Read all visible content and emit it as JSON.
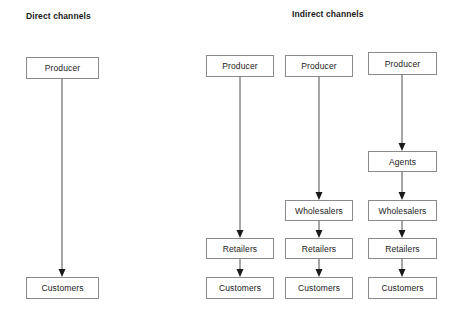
{
  "diagram": {
    "title_direct": "Direct channels",
    "title_indirect": "Indirect channels",
    "colors": {
      "background": "#ffffff",
      "box_border": "#8a8a8a",
      "text": "#1a1a1a",
      "arrow": "#4d4d4d",
      "arrow_head": "#1a1a1a"
    },
    "headings": [
      {
        "id": "direct",
        "label": "Direct channels",
        "x": 26,
        "y": 11
      },
      {
        "id": "indirect",
        "label": "Indirect channels",
        "x": 292,
        "y": 9
      }
    ],
    "nodes": [
      {
        "id": "d-producer",
        "label": "Producer",
        "x": 26,
        "y": 57,
        "w": 73,
        "h": 22
      },
      {
        "id": "d-customers",
        "label": "Customers",
        "x": 26,
        "y": 277,
        "w": 73,
        "h": 22
      },
      {
        "id": "c1-producer",
        "label": "Producer",
        "x": 206,
        "y": 55,
        "w": 68,
        "h": 22
      },
      {
        "id": "c1-retailers",
        "label": "Retailers",
        "x": 206,
        "y": 238,
        "w": 68,
        "h": 21
      },
      {
        "id": "c1-customers",
        "label": "Customers",
        "x": 206,
        "y": 277,
        "w": 68,
        "h": 22
      },
      {
        "id": "c2-producer",
        "label": "Producer",
        "x": 285,
        "y": 55,
        "w": 68,
        "h": 22
      },
      {
        "id": "c2-wholesalers",
        "label": "Wholesalers",
        "x": 285,
        "y": 200,
        "w": 68,
        "h": 21
      },
      {
        "id": "c2-retailers",
        "label": "Retailers",
        "x": 285,
        "y": 238,
        "w": 68,
        "h": 21
      },
      {
        "id": "c2-customers",
        "label": "Customers",
        "x": 285,
        "y": 277,
        "w": 68,
        "h": 22
      },
      {
        "id": "c3-producer",
        "label": "Producer",
        "x": 368,
        "y": 52,
        "w": 69,
        "h": 23
      },
      {
        "id": "c3-agents",
        "label": "Agents",
        "x": 368,
        "y": 151,
        "w": 69,
        "h": 21
      },
      {
        "id": "c3-wholesalers",
        "label": "Wholesalers",
        "x": 368,
        "y": 200,
        "w": 69,
        "h": 21
      },
      {
        "id": "c3-retailers",
        "label": "Retailers",
        "x": 368,
        "y": 238,
        "w": 69,
        "h": 21
      },
      {
        "id": "c3-customers",
        "label": "Customers",
        "x": 368,
        "y": 277,
        "w": 69,
        "h": 22
      }
    ],
    "edges": [
      {
        "id": "e-direct-prod-cust",
        "from": "d-producer",
        "to": "d-customers",
        "x": 62,
        "y1": 79,
        "y2": 277
      },
      {
        "id": "e-c1-prod-ret",
        "from": "c1-producer",
        "to": "c1-retailers",
        "x": 240,
        "y1": 77,
        "y2": 238
      },
      {
        "id": "e-c1-ret-cust",
        "from": "c1-retailers",
        "to": "c1-customers",
        "x": 240,
        "y1": 259,
        "y2": 277
      },
      {
        "id": "e-c2-prod-whole",
        "from": "c2-producer",
        "to": "c2-wholesalers",
        "x": 319,
        "y1": 77,
        "y2": 200
      },
      {
        "id": "e-c2-whole-ret",
        "from": "c2-wholesalers",
        "to": "c2-retailers",
        "x": 319,
        "y1": 221,
        "y2": 238
      },
      {
        "id": "e-c2-ret-cust",
        "from": "c2-retailers",
        "to": "c2-customers",
        "x": 319,
        "y1": 259,
        "y2": 277
      },
      {
        "id": "e-c3-prod-agents",
        "from": "c3-producer",
        "to": "c3-agents",
        "x": 402,
        "y1": 75,
        "y2": 151
      },
      {
        "id": "e-c3-agents-whole",
        "from": "c3-agents",
        "to": "c3-wholesalers",
        "x": 402,
        "y1": 172,
        "y2": 200
      },
      {
        "id": "e-c3-whole-ret",
        "from": "c3-wholesalers",
        "to": "c3-retailers",
        "x": 402,
        "y1": 221,
        "y2": 238
      },
      {
        "id": "e-c3-ret-cust",
        "from": "c3-retailers",
        "to": "c3-customers",
        "x": 402,
        "y1": 259,
        "y2": 277
      }
    ]
  }
}
